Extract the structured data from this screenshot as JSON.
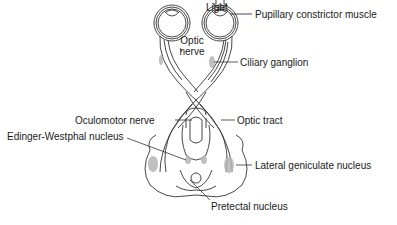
{
  "diagram": {
    "labels": {
      "light": "Light",
      "pupillary_constrictor_muscle": "Pupillary constrictor muscle",
      "optic_nerve_line1": "Optic",
      "optic_nerve_line2": "nerve",
      "ciliary_ganglion": "Ciliary ganglion",
      "oculomotor_nerve": "Oculomotor nerve",
      "optic_tract": "Optic tract",
      "edinger_westphal_nucleus": "Edinger-Westphal nucleus",
      "lateral_geniculate_nucleus": "Lateral geniculate nucleus",
      "pretectal_nucleus": "Pretectal nucleus"
    },
    "colors": {
      "line": "#333333",
      "shade": "#b5b5b5",
      "text": "#1a1a1a"
    }
  }
}
